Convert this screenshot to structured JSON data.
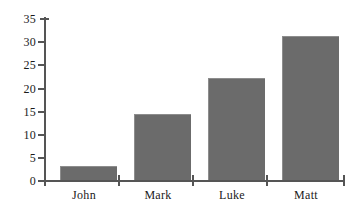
{
  "chart_data": {
    "type": "bar",
    "title": "",
    "subtitle": "",
    "xlabel": "",
    "ylabel": "",
    "categories": [
      "John",
      "Mark",
      "Luke",
      "Matt"
    ],
    "values": [
      3,
      14.3,
      22,
      31.1
    ],
    "ylim": [
      0,
      35
    ],
    "yticks": [
      0,
      5,
      10,
      15,
      20,
      25,
      30,
      35
    ],
    "ytick_labels": [
      "0",
      "5",
      "10",
      "15",
      "20",
      "25",
      "30",
      "35"
    ],
    "grid": false,
    "legend": null,
    "series": [
      {
        "name": "",
        "values": [
          3,
          14.3,
          22,
          31.1
        ]
      }
    ],
    "annotations": [],
    "colors": {
      "bar_fill": "#6b6b6b",
      "bar_edge": "#8d8d8d",
      "axis": "#555555",
      "text": "#1a1a1a",
      "background": "#ffffff"
    }
  },
  "axis": {
    "y_axis_name": "value-axis",
    "x_axis_name": "category-axis"
  }
}
